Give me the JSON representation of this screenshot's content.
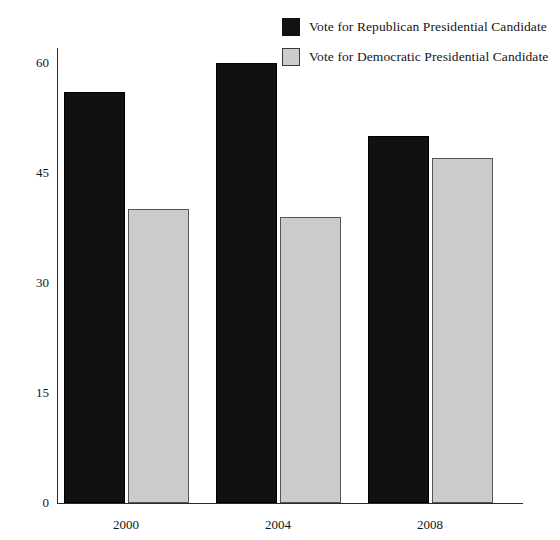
{
  "chart_data": {
    "type": "bar",
    "title": "",
    "subtitle": "",
    "xlabel": "",
    "ylabel": "",
    "categories": [
      "2000",
      "2004",
      "2008"
    ],
    "series": [
      {
        "name": "Vote for Republican Presidential Candidate",
        "color": "#111111",
        "values": [
          56,
          60,
          50
        ]
      },
      {
        "name": "Vote for Democratic Presidential Candidate",
        "color": "#cbcbcb",
        "values": [
          40,
          39,
          47
        ]
      }
    ],
    "ylim": [
      0,
      62
    ],
    "yticks": [
      "0",
      "15",
      "30",
      "45",
      "60"
    ],
    "ytick_values": [
      0,
      15,
      30,
      45,
      60
    ],
    "grid": false,
    "legend_position": "top-right"
  },
  "legend": {
    "items": [
      {
        "label": "Vote for Republican Presidential Candidate",
        "swatch": "republican-swatch"
      },
      {
        "label": "Vote for Democratic Presidential Candidate",
        "swatch": "democratic-swatch"
      }
    ]
  },
  "colors": {
    "republican": "#111111",
    "democratic": "#cbcbcb",
    "axis": "#2b2b2b",
    "text": "#161616",
    "background": "#ffffff"
  }
}
